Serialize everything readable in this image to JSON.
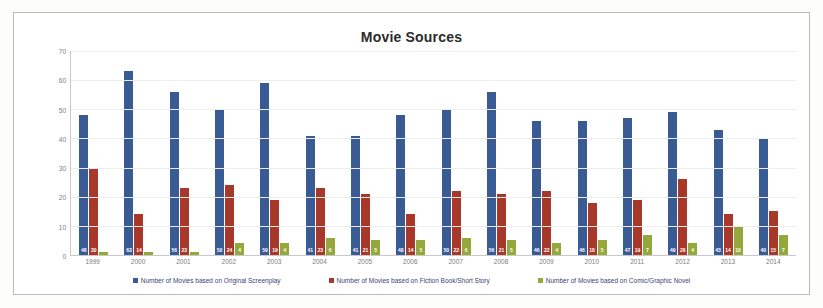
{
  "chart_data": {
    "type": "bar",
    "title": "Movie Sources",
    "xlabel": "",
    "ylabel": "",
    "ylim": [
      0,
      70
    ],
    "yticks": [
      0,
      10,
      20,
      30,
      40,
      50,
      60,
      70
    ],
    "grid": true,
    "legend_position": "bottom",
    "categories": [
      "1999",
      "2000",
      "2001",
      "2002",
      "2003",
      "2004",
      "2005",
      "2006",
      "2007",
      "2008",
      "2009",
      "2010",
      "2011",
      "2012",
      "2013",
      "2014"
    ],
    "series": [
      {
        "name": "Number of Movies based on Original Screenplay",
        "color": "#3a5a94",
        "values": [
          48,
          63,
          56,
          50,
          59,
          41,
          41,
          48,
          50,
          56,
          46,
          46,
          47,
          49,
          43,
          40
        ]
      },
      {
        "name": "Number of Movies based on Fiction Book/Short Story",
        "color": "#a8392a",
        "values": [
          30,
          14,
          23,
          24,
          19,
          23,
          21,
          14,
          22,
          21,
          22,
          18,
          19,
          26,
          14,
          15
        ]
      },
      {
        "name": "Number of Movies based on Comic/Graphic Novel",
        "color": "#94a83c",
        "values": [
          1,
          1,
          1,
          4,
          4,
          6,
          5,
          5,
          6,
          5,
          4,
          5,
          7,
          4,
          10,
          7
        ]
      }
    ]
  }
}
